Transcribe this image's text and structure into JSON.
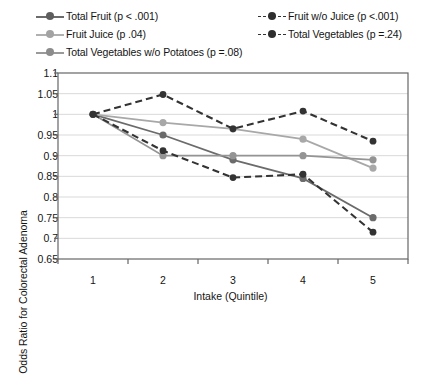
{
  "chart_data": {
    "type": "line",
    "title": "",
    "xlabel": "Intake (Quintile)",
    "ylabel": "Odds Ratio for Colorectal Adenoma",
    "categories": [
      "1",
      "2",
      "3",
      "4",
      "5"
    ],
    "x": [
      1,
      2,
      3,
      4,
      5
    ],
    "xlim": [
      0.5,
      5.5
    ],
    "ylim": [
      0.65,
      1.1
    ],
    "yticks": [
      "1.1",
      "1.05",
      "1",
      "0.95",
      "0.9",
      "0.85",
      "0.8",
      "0.75",
      "0.7",
      "0.65"
    ],
    "ytick_values": [
      1.1,
      1.05,
      1.0,
      0.95,
      0.9,
      0.85,
      0.8,
      0.75,
      0.7,
      0.65
    ],
    "xticks": [
      "1",
      "2",
      "3",
      "4",
      "5"
    ],
    "grid": "horizontal",
    "legend_position": "top",
    "series": [
      {
        "name": "Total Fruit (p < .001)",
        "values": [
          1.0,
          0.95,
          0.89,
          0.845,
          0.75
        ],
        "color": "#6b6b6b",
        "style": "solid",
        "marker": "circle"
      },
      {
        "name": "Fruit Juice (p .04)",
        "values": [
          1.0,
          0.98,
          0.965,
          0.94,
          0.87
        ],
        "color": "#a8a8a8",
        "style": "solid",
        "marker": "circle"
      },
      {
        "name": "Total Vegetables w/o Potatoes (p =.08)",
        "values": [
          1.0,
          0.9,
          0.9,
          0.9,
          0.89
        ],
        "color": "#949494",
        "style": "solid",
        "marker": "circle"
      },
      {
        "name": "Fruit w/o Juice (p <.001)",
        "values": [
          1.0,
          0.912,
          0.847,
          0.855,
          0.715
        ],
        "color": "#333333",
        "style": "dashed",
        "marker": "circle"
      },
      {
        "name": "Total Vegetables (p =.24)",
        "values": [
          1.0,
          1.048,
          0.965,
          1.008,
          0.935
        ],
        "color": "#333333",
        "style": "dashed",
        "marker": "circle"
      }
    ],
    "legend_left_column": [
      "Total Fruit (p < .001)",
      "Fruit Juice (p .04)",
      "Total Vegetables w/o Potatoes (p =.08)"
    ],
    "legend_right_column": [
      "Fruit w/o Juice (p <.001)",
      "Total Vegetables (p =.24)"
    ],
    "colors": {
      "total_fruit": "#6b6b6b",
      "fruit_juice": "#a8a8a8",
      "total_vegetables_wo_potatoes": "#949494",
      "fruit_wo_juice": "#333333",
      "total_vegetables": "#333333",
      "axis": "#666666",
      "grid": "#d9d9d9",
      "background": "#ffffff"
    }
  }
}
